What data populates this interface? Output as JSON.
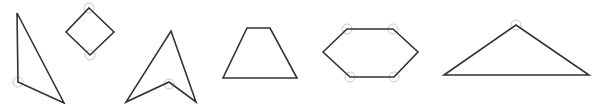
{
  "diagram": {
    "width": 600,
    "height": 104,
    "background": "#ffffff",
    "stroke_color": "#333333",
    "stroke_width": 1.6,
    "marker_color": "#c8c8c8",
    "marker_radius": 5,
    "shapes": [
      {
        "name": "right-triangle",
        "points": [
          [
            17,
            13
          ],
          [
            18,
            82
          ],
          [
            64,
            103
          ]
        ],
        "angle_markers": [
          [
            18,
            82
          ]
        ]
      },
      {
        "name": "square-rotated",
        "points": [
          [
            89,
            8
          ],
          [
            114,
            32
          ],
          [
            90,
            55
          ],
          [
            66,
            32
          ]
        ],
        "angle_markers": [
          [
            89,
            8
          ],
          [
            90,
            55
          ]
        ]
      },
      {
        "name": "concave-arrowhead",
        "points": [
          [
            171,
            31
          ],
          [
            196,
            102
          ],
          [
            169,
            82
          ],
          [
            126,
            102
          ]
        ],
        "angle_markers": [
          [
            169,
            84
          ]
        ]
      },
      {
        "name": "trapezoid",
        "points": [
          [
            247,
            28
          ],
          [
            270,
            28
          ],
          [
            297,
            78
          ],
          [
            223,
            78
          ]
        ],
        "angle_markers": []
      },
      {
        "name": "hexagon",
        "points": [
          [
            323,
            52
          ],
          [
            347,
            29
          ],
          [
            393,
            29
          ],
          [
            418,
            52
          ],
          [
            394,
            77
          ],
          [
            350,
            77
          ]
        ],
        "angle_markers": [
          [
            347,
            29
          ],
          [
            393,
            29
          ],
          [
            394,
            77
          ],
          [
            350,
            77
          ]
        ]
      },
      {
        "name": "obtuse-triangle",
        "points": [
          [
            444,
            75
          ],
          [
            516,
            25
          ],
          [
            589,
            75
          ]
        ],
        "angle_markers": [
          [
            516,
            25
          ]
        ]
      }
    ]
  }
}
